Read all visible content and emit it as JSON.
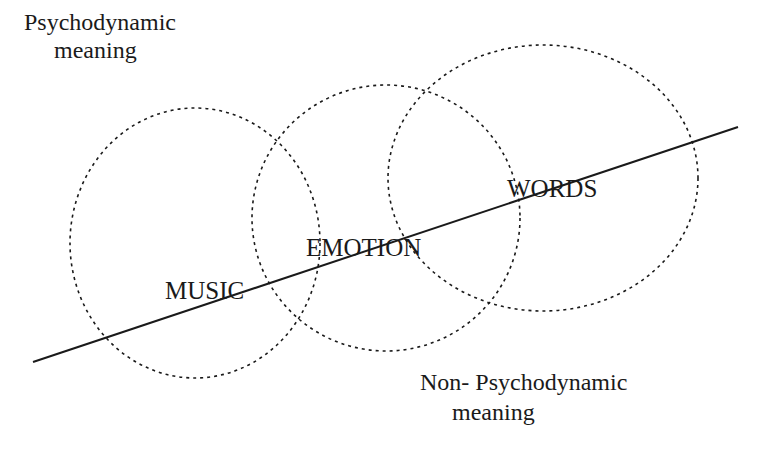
{
  "diagram": {
    "regions": {
      "upper": {
        "line1": "Psychodynamic",
        "line2": "meaning"
      },
      "lower": {
        "line1": "Non- Psychodynamic",
        "line2": "meaning"
      }
    },
    "circles": [
      {
        "label": "MUSIC"
      },
      {
        "label": "EMOTION"
      },
      {
        "label": "WORDS"
      }
    ],
    "colors": {
      "stroke": "#1a1a1a",
      "background": "#ffffff"
    }
  }
}
